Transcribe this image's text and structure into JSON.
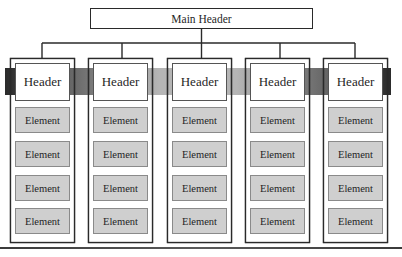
{
  "main_header": {
    "label": "Main Header"
  },
  "columns": [
    {
      "header": "Header",
      "elements": [
        "Element",
        "Element",
        "Element",
        "Element"
      ]
    },
    {
      "header": "Header",
      "elements": [
        "Element",
        "Element",
        "Element",
        "Element"
      ]
    },
    {
      "header": "Header",
      "elements": [
        "Element",
        "Element",
        "Element",
        "Element"
      ]
    },
    {
      "header": "Header",
      "elements": [
        "Element",
        "Element",
        "Element",
        "Element"
      ]
    },
    {
      "header": "Header",
      "elements": [
        "Element",
        "Element",
        "Element",
        "Element"
      ]
    }
  ],
  "colors": {
    "line": "#2a2a2a",
    "element_fill": "#cfcfcf",
    "element_stroke": "#8a8a8a",
    "band_dark": "#2b2b2b",
    "band_mid": "#6a6a6a",
    "band_light": "#b5b5b5"
  }
}
